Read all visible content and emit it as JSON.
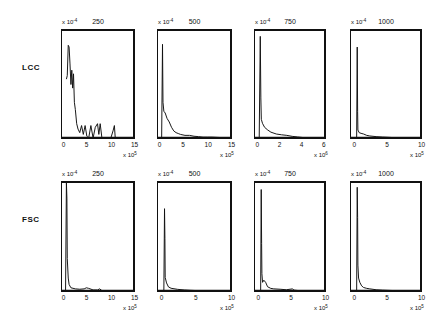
{
  "chart_data": {
    "type": "line",
    "layout": "2x4 grid of histograms",
    "rows": [
      "LCC",
      "FSC"
    ],
    "columns": [
      "250",
      "500",
      "750",
      "1000"
    ],
    "panels": [
      {
        "row": "LCC",
        "title": "250",
        "y_exponent": "x 10^-4",
        "x_exponent": "x 10^5",
        "ylim": [
          0,
          6
        ],
        "xlim": [
          -1,
          15
        ],
        "yticks": [
          "0",
          "1",
          "2",
          "3",
          "4",
          "5",
          "6"
        ],
        "xticks": [
          "0",
          "5",
          "10",
          "15"
        ],
        "x": [
          0,
          0.2,
          0.4,
          0.6,
          0.8,
          1,
          1.2,
          1.4,
          1.6,
          1.8,
          2,
          2.3,
          2.6,
          3,
          3.4,
          3.8,
          4.2,
          4.6,
          5,
          5.5,
          6,
          6.5,
          7,
          7.3,
          7.6,
          8,
          9,
          10,
          10.5,
          10.8,
          11,
          15
        ],
        "y": [
          3.3,
          3.5,
          5.2,
          5.1,
          4.2,
          3.0,
          3.8,
          2.8,
          3.6,
          2.0,
          1.6,
          0.8,
          0.5,
          0.3,
          0.7,
          0.2,
          0.7,
          0.1,
          0,
          0.7,
          0,
          0.6,
          0.8,
          0.2,
          0.8,
          0,
          0,
          0,
          0.4,
          0.7,
          0,
          0
        ]
      },
      {
        "row": "LCC",
        "title": "500",
        "y_exponent": "x 10^-4",
        "x_exponent": "x 10^5",
        "ylim": [
          0,
          1.2
        ],
        "xlim": [
          -1,
          15
        ],
        "yticks": [
          "0",
          "0.2",
          "0.4",
          "0.6",
          "0.8",
          "1",
          "1.2"
        ],
        "xticks": [
          "0",
          "5",
          "10",
          "15"
        ],
        "x": [
          -0.2,
          0,
          0.1,
          0.3,
          0.6,
          1,
          1.5,
          2,
          2.5,
          3,
          3.5,
          4,
          5,
          6,
          7,
          8,
          9,
          10,
          11,
          15
        ],
        "y": [
          0,
          1.05,
          0.4,
          0.3,
          0.28,
          0.22,
          0.18,
          0.12,
          0.08,
          0.06,
          0.05,
          0.04,
          0.03,
          0.03,
          0.02,
          0.015,
          0.01,
          0.01,
          0.01,
          0
        ]
      },
      {
        "row": "LCC",
        "title": "750",
        "y_exponent": "x 10^-4",
        "x_exponent": "x 10^6",
        "ylim": [
          0,
          4
        ],
        "xlim": [
          -0.5,
          6
        ],
        "yticks": [
          "0",
          "1",
          "2",
          "3",
          "4"
        ],
        "xticks": [
          "0",
          "2",
          "4",
          "6"
        ],
        "x": [
          -0.1,
          0,
          0.05,
          0.1,
          0.2,
          0.4,
          0.7,
          1,
          1.5,
          2,
          2.5,
          3,
          3.5,
          4,
          4.5,
          6
        ],
        "y": [
          0,
          3.8,
          1.5,
          0.7,
          0.55,
          0.4,
          0.3,
          0.22,
          0.15,
          0.12,
          0.1,
          0.06,
          0.04,
          0.02,
          0.01,
          0
        ]
      },
      {
        "row": "LCC",
        "title": "1000",
        "y_exponent": "x 10^-4",
        "x_exponent": "x 10^5",
        "ylim": [
          0,
          8
        ],
        "xlim": [
          -1,
          10
        ],
        "yticks": [
          "0",
          "2",
          "4",
          "6",
          "8"
        ],
        "xticks": [
          "0",
          "5",
          "10"
        ],
        "x": [
          -0.1,
          0,
          0.05,
          0.1,
          0.3,
          0.6,
          1,
          1.5,
          2,
          3,
          4,
          5,
          6,
          10
        ],
        "y": [
          0,
          6.8,
          2.0,
          0.6,
          0.4,
          0.35,
          0.3,
          0.2,
          0.15,
          0.1,
          0.07,
          0.05,
          0.02,
          0
        ]
      },
      {
        "row": "FSC",
        "title": "250",
        "y_exponent": "x 10^-4",
        "x_exponent": "x 10^5",
        "ylim": [
          0,
          5
        ],
        "xlim": [
          -1,
          15
        ],
        "yticks": [
          "0",
          "1",
          "2",
          "3",
          "4",
          "5"
        ],
        "xticks": [
          "0",
          "5",
          "10",
          "15"
        ],
        "x": [
          -0.2,
          0,
          0.1,
          0.2,
          0.4,
          0.6,
          1,
          2,
          3,
          4,
          4.5,
          5,
          6,
          7,
          7.5,
          8,
          10,
          15
        ],
        "y": [
          0,
          5,
          4.3,
          1.5,
          0.6,
          0.3,
          0.15,
          0.1,
          0.08,
          0.1,
          0.15,
          0.12,
          0.05,
          0.05,
          0.1,
          0.02,
          0.01,
          0
        ]
      },
      {
        "row": "FSC",
        "title": "500",
        "y_exponent": "x 10^-4",
        "x_exponent": "x 10^5",
        "ylim": [
          0,
          8
        ],
        "xlim": [
          -1,
          10
        ],
        "yticks": [
          "0",
          "2",
          "4",
          "6",
          "8"
        ],
        "xticks": [
          "0",
          "5",
          "10"
        ],
        "x": [
          -0.1,
          0,
          0.05,
          0.1,
          0.3,
          0.6,
          1,
          2,
          3,
          4,
          5,
          10
        ],
        "y": [
          0,
          6.1,
          3.9,
          1.0,
          0.6,
          0.3,
          0.2,
          0.12,
          0.08,
          0.05,
          0.03,
          0
        ]
      },
      {
        "row": "FSC",
        "title": "750",
        "y_exponent": "x 10^-4",
        "x_exponent": "x 10^5",
        "ylim": [
          0,
          2.5
        ],
        "xlim": [
          -1,
          10
        ],
        "yticks": [
          "0",
          "0.5",
          "1",
          "1.5",
          "2",
          "2.5"
        ],
        "xticks": [
          "0",
          "5",
          "10"
        ],
        "x": [
          -0.1,
          0,
          0.05,
          0.1,
          0.2,
          0.4,
          0.7,
          1,
          1.5,
          2,
          3,
          4,
          5,
          5.2,
          6,
          10
        ],
        "y": [
          0,
          2.35,
          1.1,
          0.4,
          0.2,
          0.25,
          0.2,
          0.1,
          0.06,
          0.05,
          0.04,
          0.03,
          0.05,
          0.02,
          0.01,
          0
        ]
      },
      {
        "row": "FSC",
        "title": "1000",
        "y_exponent": "x 10^-4",
        "x_exponent": "x 10^5",
        "ylim": [
          0,
          2.5
        ],
        "xlim": [
          -1,
          10
        ],
        "yticks": [
          "0",
          "0.5",
          "1",
          "1.5",
          "2",
          "2.5"
        ],
        "xticks": [
          "0",
          "5",
          "10"
        ],
        "x": [
          -0.1,
          0,
          0.05,
          0.1,
          0.2,
          0.4,
          0.7,
          1,
          1.5,
          2,
          3,
          4,
          6,
          8,
          10
        ],
        "y": [
          0,
          2.4,
          1.7,
          0.6,
          0.3,
          0.2,
          0.12,
          0.08,
          0.06,
          0.05,
          0.03,
          0.02,
          0.01,
          0.01,
          0
        ]
      }
    ]
  },
  "labels": {
    "row_lcc": "LCC",
    "row_fsc": "FSC",
    "titles": [
      "250",
      "500",
      "750",
      "1000"
    ],
    "y_exp_prefix": "x 10",
    "y_exp_power": "-4",
    "x_exp_prefix": "x 10",
    "x_exp_powers": {
      "lcc": [
        "5",
        "5",
        "6",
        "5"
      ],
      "fsc": [
        "5",
        "5",
        "5",
        "5"
      ]
    }
  }
}
